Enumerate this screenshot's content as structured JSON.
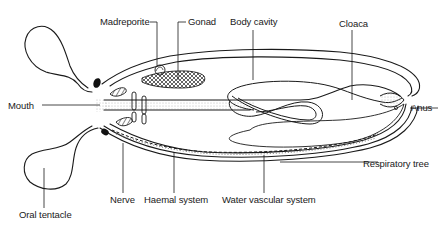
{
  "diagram": {
    "type": "anatomical-cross-section",
    "colors": {
      "stroke": "#1a1a1a",
      "background": "#ffffff",
      "stipple": "#888888"
    },
    "labels": {
      "madreporite": "Madreporite",
      "gonad": "Gonad",
      "body_cavity": "Body cavity",
      "cloaca": "Cloaca",
      "mouth": "Mouth",
      "anus": "Anus",
      "respiratory_tree": "Respiratory tree",
      "nerve": "Nerve",
      "haemal_system": "Haemal system",
      "water_vascular_system": "Water vascular system",
      "oral_tentacle": "Oral tentacle"
    }
  }
}
